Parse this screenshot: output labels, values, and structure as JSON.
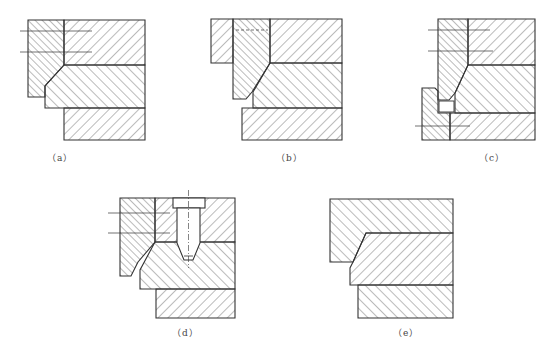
{
  "figure": {
    "stroke_color": "#333333",
    "hatch_color": "#555555",
    "background": "#ffffff"
  },
  "subfigures": [
    {
      "id": "a",
      "label": "（a）",
      "label_x": 47,
      "label_y": 151
    },
    {
      "id": "b",
      "label": "（b）",
      "label_x": 276,
      "label_y": 151
    },
    {
      "id": "c",
      "label": "（c）",
      "label_x": 479,
      "label_y": 151
    },
    {
      "id": "d",
      "label": "（d）",
      "label_x": 172,
      "label_y": 326
    },
    {
      "id": "e",
      "label": "（e）",
      "label_x": 393,
      "label_y": 326
    }
  ]
}
